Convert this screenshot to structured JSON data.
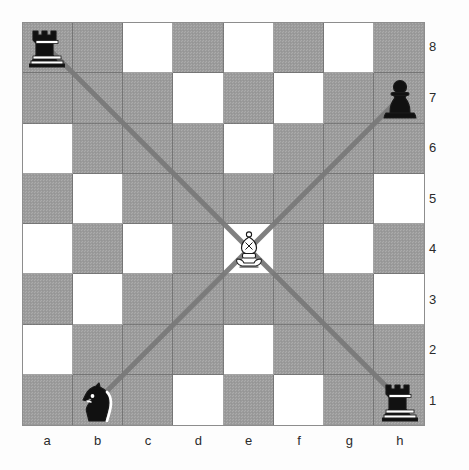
{
  "board": {
    "orientation": "white-bottom",
    "files": [
      "a",
      "b",
      "c",
      "d",
      "e",
      "f",
      "g",
      "h"
    ],
    "ranks": [
      "8",
      "7",
      "6",
      "5",
      "4",
      "3",
      "2",
      "1"
    ],
    "colors": {
      "light_square": "#ffffff",
      "dark_square": "#9d9d9d",
      "border": "#8d8d8d",
      "ray": "#7a7a7a",
      "label": "#2b2b2b",
      "piece_black": "#111111",
      "piece_white_fill": "#ffffff",
      "piece_outline": "#1a1a1a"
    },
    "square_shades": [
      [
        "dark",
        "dark",
        "light",
        "dark",
        "light",
        "dark",
        "light",
        "dark"
      ],
      [
        "dark",
        "dark",
        "dark",
        "light",
        "dark",
        "light",
        "dark",
        "dark"
      ],
      [
        "light",
        "dark",
        "dark",
        "dark",
        "light",
        "dark",
        "dark",
        "dark"
      ],
      [
        "dark",
        "light",
        "dark",
        "dark",
        "dark",
        "dark",
        "dark",
        "light"
      ],
      [
        "light",
        "dark",
        "light",
        "dark",
        "light",
        "dark",
        "light",
        "dark"
      ],
      [
        "dark",
        "light",
        "dark",
        "dark",
        "dark",
        "dark",
        "dark",
        "light"
      ],
      [
        "light",
        "dark",
        "dark",
        "dark",
        "light",
        "dark",
        "dark",
        "dark"
      ],
      [
        "dark",
        "dark",
        "dark",
        "light",
        "dark",
        "light",
        "dark",
        "dark"
      ]
    ],
    "pieces": [
      {
        "square": "a8",
        "file": 0,
        "rank": 0,
        "color": "black",
        "type": "rook",
        "glyph": "♜",
        "name": "black-rook-a8"
      },
      {
        "square": "h7",
        "file": 7,
        "rank": 1,
        "color": "black",
        "type": "pawn",
        "glyph": "♟",
        "name": "black-pawn-h7"
      },
      {
        "square": "e4",
        "file": 4,
        "rank": 4,
        "color": "white",
        "type": "bishop",
        "glyph": "♗",
        "name": "white-bishop-e4"
      },
      {
        "square": "b1",
        "file": 1,
        "rank": 7,
        "color": "black",
        "type": "knight",
        "glyph": "♞",
        "name": "black-knight-b1"
      },
      {
        "square": "h1",
        "file": 7,
        "rank": 7,
        "color": "black",
        "type": "rook",
        "glyph": "♜",
        "name": "black-rook-h1"
      }
    ],
    "rays": [
      {
        "name": "ray-e4-to-a8",
        "from": "e4",
        "to": "a8",
        "direction": "up-left"
      },
      {
        "name": "ray-e4-to-h7",
        "from": "e4",
        "to": "h7",
        "direction": "up-right"
      },
      {
        "name": "ray-e4-to-b1",
        "from": "e4",
        "to": "b1",
        "direction": "down-left"
      },
      {
        "name": "ray-e4-to-h1",
        "from": "e4",
        "to": "h1",
        "direction": "down-right"
      }
    ]
  },
  "chart_data": {
    "type": "table",
    "categories": [
      "a",
      "b",
      "c",
      "d",
      "e",
      "f",
      "g",
      "h"
    ],
    "values": [
      8,
      7,
      6,
      5,
      4,
      3,
      2,
      1
    ],
    "xlabel": "file",
    "ylabel": "rank",
    "annotations": [
      "Black rook a8",
      "Black pawn h7",
      "White bishop e4",
      "Black knight b1",
      "Black rook h1",
      "Diagonals drawn from e4 to a8, h7, b1 and h1"
    ]
  }
}
